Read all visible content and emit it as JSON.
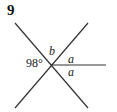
{
  "problem": {
    "number": "9"
  },
  "diagram": {
    "labels": {
      "angle_left": "98°",
      "angle_top": "b",
      "angle_right_upper": "a",
      "angle_right_lower": "a"
    },
    "colors": {
      "line": "#333333",
      "text": "#222222"
    }
  }
}
